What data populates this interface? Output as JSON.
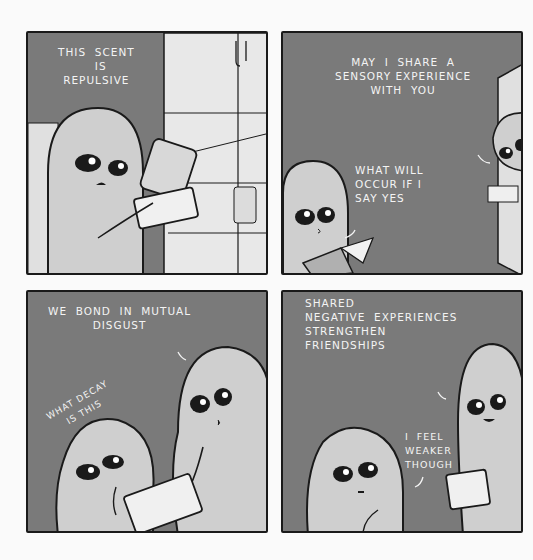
{
  "comic": {
    "layout": "2x2 grid",
    "colors": {
      "page_bg": "#fafafa",
      "panel_bg": "#7a7a7a",
      "alien_skin": "#cfcfcf",
      "outline": "#1a1a1a",
      "text": "#f4f4f4",
      "fridge": "#e6e6e6"
    },
    "panels": [
      {
        "id": "panel-1",
        "scene": "alien opening fridge holding food container",
        "dialogue": [
          {
            "speaker": "alien",
            "text": "THIS  SCENT\n  IS\nREPULSIVE"
          }
        ]
      },
      {
        "id": "panel-2",
        "scene": "alien peeking from door holding container; second alien reading book",
        "dialogue": [
          {
            "speaker": "alien-at-door",
            "text": "MAY  I  SHARE  A\nSENSORY EXPERIENCE\nWITH  YOU"
          },
          {
            "speaker": "reading-alien",
            "text": "WHAT WILL\nOCCUR IF I\nSAY YES"
          }
        ]
      },
      {
        "id": "panel-3",
        "scene": "tall alien holding container toward small alien who covers mouth",
        "dialogue": [
          {
            "speaker": "tall-alien",
            "text": "WE  BOND  IN  MUTUAL\nDISGUST"
          },
          {
            "speaker": "small-alien",
            "text": "WHAT DECAY\nIS THIS"
          }
        ]
      },
      {
        "id": "panel-4",
        "scene": "tall alien smiling with container; small alien looking weak",
        "dialogue": [
          {
            "speaker": "tall-alien",
            "text": "SHARED\nNEGATIVE  EXPERIENCES\nSTRENGTHEN\nFRIENDSHIPS"
          },
          {
            "speaker": "small-alien",
            "text": "I  FEEL\nWEAKER\nTHOUGH"
          }
        ]
      }
    ]
  }
}
